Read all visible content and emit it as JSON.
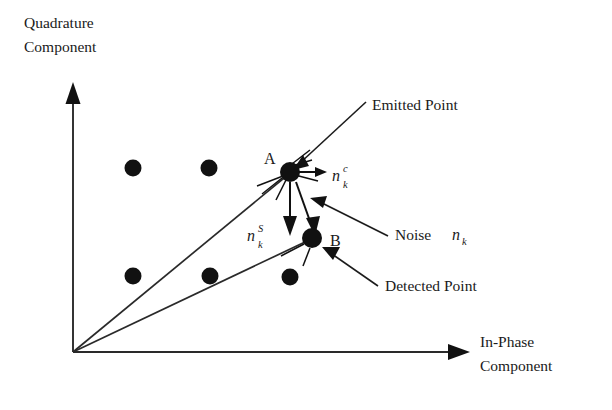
{
  "figure": {
    "background_color": "#ffffff",
    "ink_color": "#111111",
    "width": 612,
    "height": 410
  },
  "axes": {
    "y_axis": {
      "label_line1": "Quadrature",
      "label_line2": "Component",
      "icon": "arrow-up-icon"
    },
    "x_axis": {
      "label_line1": "In-Phase",
      "label_line2": "Component",
      "icon": "arrow-right-icon"
    },
    "origin": {
      "x": 73,
      "y": 352
    }
  },
  "constellation": {
    "dot_radius": 8.5,
    "points": [
      {
        "id": "c1",
        "x": 133,
        "y": 168,
        "name": "constellation-dot-1"
      },
      {
        "id": "c2",
        "x": 209,
        "y": 168,
        "name": "constellation-dot-2"
      },
      {
        "id": "c3",
        "x": 133,
        "y": 276,
        "name": "constellation-dot-3"
      },
      {
        "id": "c4",
        "x": 210,
        "y": 276,
        "name": "constellation-dot-4"
      },
      {
        "id": "c5",
        "x": 290,
        "y": 277,
        "name": "constellation-dot-5"
      }
    ]
  },
  "marked_points": {
    "emitted": {
      "label": "A",
      "x": 290,
      "y": 172,
      "radius": 10,
      "label_x": 264,
      "label_y": 164
    },
    "detected": {
      "label": "B",
      "x": 312,
      "y": 238,
      "radius": 10,
      "label_x": 330,
      "label_y": 246
    }
  },
  "callouts": [
    {
      "id": "emitted",
      "text": "Emitted Point",
      "x": 372,
      "y": 110,
      "name": "callout-emitted-point"
    },
    {
      "id": "noise",
      "text": "Noise ",
      "math": {
        "base": "n",
        "sub": "k",
        "sup": ""
      },
      "x": 395,
      "y": 240,
      "name": "callout-noise"
    },
    {
      "id": "detected",
      "text": "Detected Point",
      "x": 385,
      "y": 291,
      "name": "callout-detected-point"
    }
  ],
  "noise_components": [
    {
      "id": "inphase",
      "base": "n",
      "sup": "c",
      "sub": "k",
      "x": 332,
      "y": 181,
      "name": "noise-component-inphase-label"
    },
    {
      "id": "quadrature",
      "base": "n",
      "sup": "S",
      "sub": "k",
      "x": 247,
      "y": 241,
      "name": "noise-component-quadrature-label"
    }
  ]
}
